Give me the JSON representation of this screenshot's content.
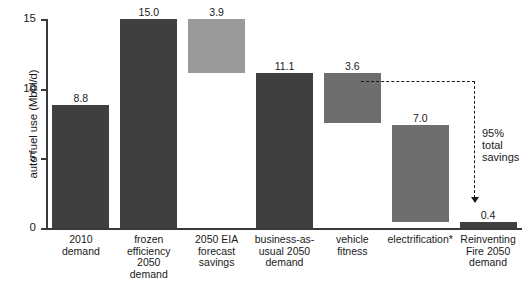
{
  "chart_data": {
    "type": "bar",
    "title": "",
    "xlabel": "",
    "ylabel": "auto fuel use (Mbbl/d)",
    "ylim": [
      0,
      15.6
    ],
    "yticks": [
      "0",
      "5",
      "10",
      "15"
    ],
    "ytick_values": [
      0,
      5,
      10,
      15
    ],
    "grid": false,
    "legend": "none",
    "waterfall": true,
    "categories": [
      "2010\ndemand",
      "frozen\nefficiency\n2050\ndemand",
      "2050 EIA\nforecast\nsavings",
      "business-as-\nusual 2050\ndemand",
      "vehicle\nfitness",
      "electrification*",
      "Reinventing\nFire 2050\ndemand"
    ],
    "values": [
      8.8,
      15.0,
      3.9,
      11.1,
      3.6,
      7.0,
      0.4
    ],
    "value_labels": [
      "8.8",
      "15.0",
      "3.9",
      "11.1",
      "3.6",
      "7.0",
      "0.4"
    ],
    "bar_bases": [
      0,
      0,
      11.1,
      0,
      7.5,
      0.4,
      0
    ],
    "bar_tops": [
      8.8,
      15.0,
      15.0,
      11.1,
      11.1,
      7.4,
      0.4
    ],
    "bar_shades": [
      "dark",
      "dark",
      "light",
      "dark",
      "mid",
      "mid",
      "dark"
    ],
    "annotations": [
      {
        "text": "95%\ntotal\nsavings",
        "from_value": 11.1,
        "to_value": 0.4,
        "style": "dashed-arrow"
      }
    ]
  },
  "colors": {
    "dark_bar": "#3f3f3f",
    "light_bar": "#9a9a9a",
    "mid_bar": "#6e6e6e",
    "axis": "#3a3a3a",
    "text": "#1a1a1a",
    "background": "#ffffff"
  },
  "axis": {
    "ytick_0": "0",
    "ytick_1": "5",
    "ytick_2": "10",
    "ytick_3": "15",
    "ylabel": "auto fuel use (Mbbl/d)"
  },
  "bars": [
    {
      "label": "2010\ndemand",
      "value": "8.8"
    },
    {
      "label": "frozen\nefficiency\n2050\ndemand",
      "value": "15.0"
    },
    {
      "label": "2050 EIA\nforecast\nsavings",
      "value": "3.9"
    },
    {
      "label": "business-as-\nusual 2050\ndemand",
      "value": "11.1"
    },
    {
      "label": "vehicle\nfitness",
      "value": "3.6"
    },
    {
      "label": "electrification*",
      "value": "7.0"
    },
    {
      "label": "Reinventing\nFire 2050\ndemand",
      "value": "0.4"
    }
  ],
  "annotation": {
    "savings_text": "95%\ntotal\nsavings"
  }
}
